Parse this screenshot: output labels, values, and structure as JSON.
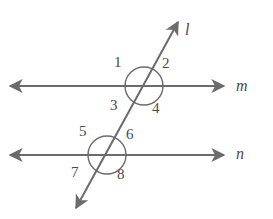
{
  "figure": {
    "type": "geometry-diagram",
    "background_color": "#ffffff",
    "stroke_color": "#6b6b6b",
    "text_color": "#4a4a4a"
  },
  "lines": [
    {
      "id": "transversal",
      "label": "l",
      "label_x": 185,
      "label_y": 22,
      "x1": 76,
      "y1": 208,
      "x2": 178,
      "y2": 22,
      "arrow_start": true,
      "arrow_end": true
    },
    {
      "id": "line-m",
      "label": "m",
      "label_x": 236,
      "label_y": 78,
      "x1": 10,
      "y1": 86,
      "x2": 224,
      "y2": 86,
      "arrow_start": true,
      "arrow_end": true
    },
    {
      "id": "line-n",
      "label": "n",
      "label_x": 236,
      "label_y": 146,
      "x1": 10,
      "y1": 155,
      "x2": 224,
      "y2": 155,
      "arrow_start": true,
      "arrow_end": true
    }
  ],
  "intersections": [
    {
      "id": "upper-intersection",
      "cx": 144,
      "cy": 86,
      "r": 19
    },
    {
      "id": "lower-intersection",
      "cx": 107,
      "cy": 155,
      "r": 19
    }
  ],
  "angles": [
    {
      "id": "angle-1",
      "label": "1",
      "x": 114,
      "y": 55
    },
    {
      "id": "angle-2",
      "label": "2",
      "x": 162,
      "y": 56
    },
    {
      "id": "angle-3",
      "label": "3",
      "x": 110,
      "y": 98
    },
    {
      "id": "angle-4",
      "label": "4",
      "x": 152,
      "y": 101
    },
    {
      "id": "angle-5",
      "label": "5",
      "x": 79,
      "y": 124
    },
    {
      "id": "angle-6",
      "label": "6",
      "x": 126,
      "y": 127
    },
    {
      "id": "angle-7",
      "label": "7",
      "x": 71,
      "y": 165
    },
    {
      "id": "angle-8",
      "label": "8",
      "x": 117,
      "y": 167
    }
  ]
}
